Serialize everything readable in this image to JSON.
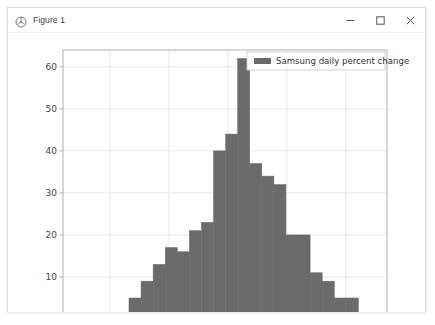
{
  "window": {
    "title": "Figure 1",
    "icon": "matplotlib-figure-icon",
    "controls": [
      {
        "name": "minimize-button",
        "glyph": "minimize-icon"
      },
      {
        "name": "maximize-button",
        "glyph": "maximize-icon"
      },
      {
        "name": "close-button",
        "glyph": "close-icon"
      }
    ]
  },
  "colors": {
    "bar": "#6b6b6b",
    "bar_edge": "#6b6b6b",
    "grid": "#e8e8e8",
    "axis": "#b0b0b0",
    "tick_text": "#444444",
    "legend_border": "#cccccc",
    "window_border": "#dcdcdc",
    "title_text": "#3b3b3b"
  },
  "chart_data": {
    "type": "bar",
    "title": "",
    "xlabel": "",
    "ylabel": "",
    "xlim": [
      -5.6,
      5.4
    ],
    "ylim": [
      0,
      64
    ],
    "xticks": [
      -4,
      -2,
      0,
      2,
      4
    ],
    "xtick_labels": [
      "−4",
      "−2",
      "0",
      "2",
      "4"
    ],
    "yticks": [
      0,
      10,
      20,
      30,
      40,
      50,
      60
    ],
    "ytick_labels": [
      "0",
      "10",
      "20",
      "30",
      "40",
      "50",
      "60"
    ],
    "grid": true,
    "legend": {
      "position": "upper right",
      "entries": [
        {
          "label": "Samsung daily percent change",
          "color": "#6b6b6b"
        }
      ]
    },
    "bin_width": 0.41,
    "bin_edges": [
      -5.0,
      -4.59,
      -4.18,
      -3.77,
      -3.36,
      -2.95,
      -2.54,
      -2.13,
      -1.72,
      -1.31,
      -0.9,
      -0.49,
      -0.08,
      0.33,
      0.74,
      1.15,
      1.56,
      1.97,
      2.38,
      2.79,
      3.2,
      3.61,
      4.02,
      4.43,
      4.84
    ],
    "categories": [
      "-5.00 to -4.59",
      "-4.59 to -4.18",
      "-4.18 to -3.77",
      "-3.77 to -3.36",
      "-3.36 to -2.95",
      "-2.95 to -2.54",
      "-2.54 to -2.13",
      "-2.13 to -1.72",
      "-1.72 to -1.31",
      "-1.31 to -0.90",
      "-0.90 to -0.49",
      "-0.49 to -0.08",
      "-0.08 to 0.33",
      "0.33 to 0.74",
      "0.74 to 1.15",
      "1.15 to 1.56",
      "1.56 to 1.97",
      "1.97 to 2.38",
      "2.38 to 2.79",
      "2.79 to 3.20",
      "3.20 to 3.61",
      "3.61 to 4.02",
      "4.02 to 4.43",
      "4.43 to 4.84"
    ],
    "values": [
      1,
      1,
      1,
      1,
      5,
      9,
      13,
      17,
      16,
      21,
      23,
      40,
      44,
      62,
      37,
      34,
      32,
      20,
      20,
      11,
      9,
      5,
      5,
      1
    ]
  }
}
